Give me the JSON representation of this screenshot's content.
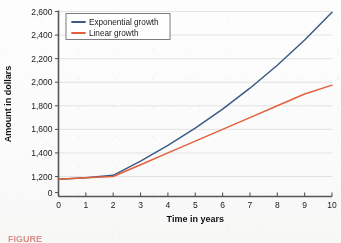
{
  "figure": {
    "caption_partial": "FIGURE",
    "caption_color": "#c0392b"
  },
  "chart_data": {
    "type": "line",
    "title": "",
    "xlabel": "Time in years",
    "ylabel": "Amount in dollars",
    "xlim": [
      0,
      10
    ],
    "ylim": [
      1000,
      2600
    ],
    "y_axis_broken": true,
    "y_break_note": "Axis jumps from 0 directly to 1,200",
    "grid": "horizontal",
    "legend_position": "top-left",
    "xticks": [
      "0",
      "1",
      "2",
      "3",
      "4",
      "5",
      "6",
      "7",
      "8",
      "9",
      "10"
    ],
    "yticks": [
      "0",
      "1,200",
      "1,400",
      "1,600",
      "1,800",
      "2,000",
      "2,200",
      "2,400",
      "2,600"
    ],
    "x": [
      0,
      1,
      2,
      3,
      4,
      5,
      6,
      7,
      8,
      9,
      10
    ],
    "series": [
      {
        "name": "Exponential growth",
        "color": "#3c5a86",
        "values": [
          1000,
          1100,
          1210,
          1331,
          1464,
          1611,
          1772,
          1949,
          2144,
          2358,
          2594
        ]
      },
      {
        "name": "Linear growth",
        "color": "#e4603c",
        "values": [
          1000,
          1100,
          1200,
          1300,
          1400,
          1500,
          1600,
          1700,
          1800,
          1900,
          1975
        ]
      }
    ]
  },
  "legend": {
    "entries": [
      {
        "label": "Exponential growth"
      },
      {
        "label": "Linear growth"
      }
    ]
  },
  "axes": {
    "x_title": "Time in years",
    "y_title": "Amount in dollars"
  }
}
